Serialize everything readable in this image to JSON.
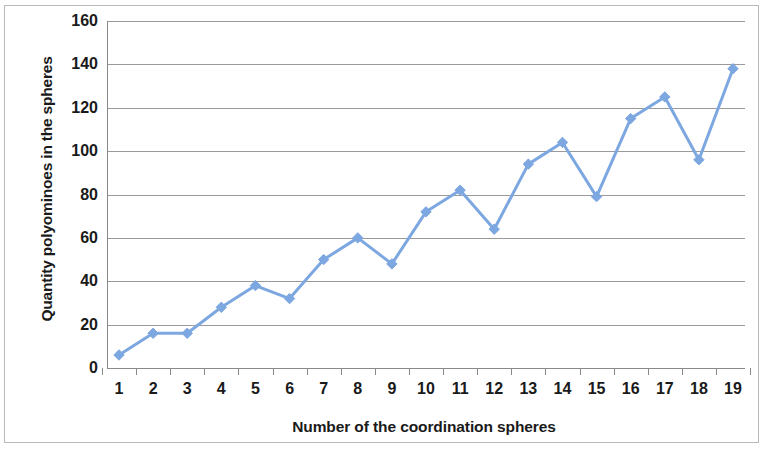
{
  "chart_data": {
    "type": "line",
    "title": "",
    "xlabel": "Number of the coordination spheres",
    "ylabel": "Quantity polyominoes in the spheres",
    "x": [
      1,
      2,
      3,
      4,
      5,
      6,
      7,
      8,
      9,
      10,
      11,
      12,
      13,
      14,
      15,
      16,
      17,
      18,
      19
    ],
    "categories": [
      "1",
      "2",
      "3",
      "4",
      "5",
      "6",
      "7",
      "8",
      "9",
      "10",
      "11",
      "12",
      "13",
      "14",
      "15",
      "16",
      "17",
      "18",
      "19"
    ],
    "values": [
      6,
      16,
      16,
      28,
      38,
      32,
      50,
      60,
      48,
      72,
      82,
      64,
      94,
      104,
      79,
      115,
      125,
      96,
      138
    ],
    "series": [
      {
        "name": "Quantity polyominoes in the spheres",
        "values": [
          6,
          16,
          16,
          28,
          38,
          32,
          50,
          60,
          48,
          72,
          82,
          64,
          94,
          104,
          79,
          115,
          125,
          96,
          138
        ]
      }
    ],
    "ylim": [
      0,
      160
    ],
    "xlim": [
      1,
      19
    ],
    "yticks": [
      0,
      20,
      40,
      60,
      80,
      100,
      120,
      140,
      160
    ],
    "ytick_labels": [
      "0",
      "20",
      "40",
      "60",
      "80",
      "100",
      "120",
      "140",
      "160"
    ],
    "xtick_labels": [
      "1",
      "2",
      "3",
      "4",
      "5",
      "6",
      "7",
      "8",
      "9",
      "10",
      "11",
      "12",
      "13",
      "14",
      "15",
      "16",
      "17",
      "18",
      "19"
    ],
    "grid": true,
    "grid_axis": "y",
    "legend": false,
    "legend_position": "none",
    "marker": "diamond",
    "line_color": "#7da7e0",
    "marker_color": "#7da7e0",
    "gridline_color": "#9a9a9a",
    "background_color": "#ffffff",
    "border_color": "#b9b9b9"
  }
}
